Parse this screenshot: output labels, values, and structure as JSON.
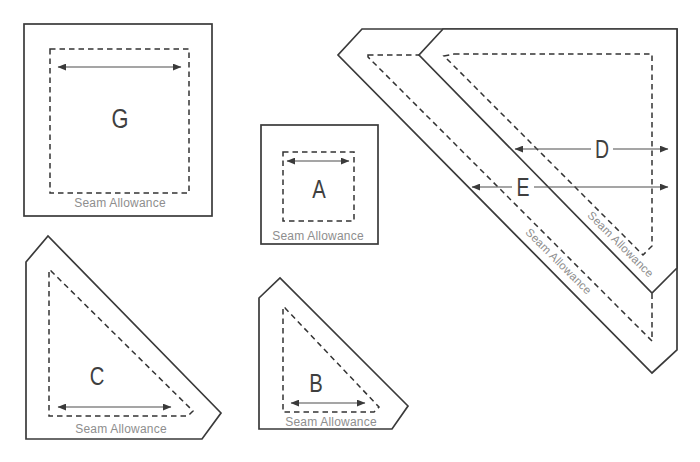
{
  "diagram": {
    "seam_label": "Seam Allowance",
    "colors": {
      "cut_line": "#3a3a3a",
      "seam_line": "#333333",
      "arrow": "#4d4d4d",
      "seam_text": "#8e8e8e",
      "background": "#ffffff"
    },
    "templates": [
      {
        "id": "G",
        "label": "G",
        "shape": "square"
      },
      {
        "id": "A",
        "label": "A",
        "shape": "square"
      },
      {
        "id": "C",
        "label": "C",
        "shape": "triangle"
      },
      {
        "id": "B",
        "label": "B",
        "shape": "triangle"
      },
      {
        "id": "D",
        "label": "D",
        "shape": "triangle"
      },
      {
        "id": "E",
        "label": "E",
        "shape": "triangle"
      }
    ]
  }
}
